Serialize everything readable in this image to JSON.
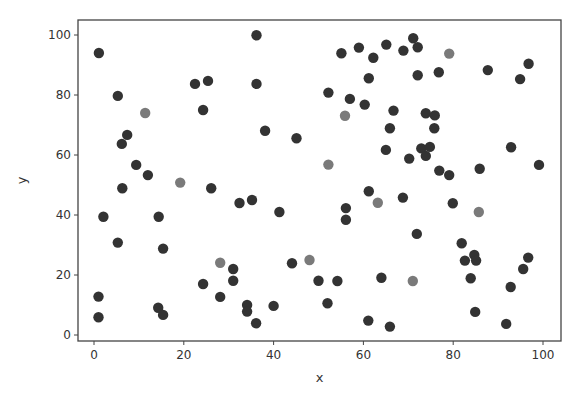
{
  "chart_data": {
    "type": "scatter",
    "title": "",
    "xlabel": "x",
    "ylabel": "y",
    "xlim": [
      -3.5,
      104
    ],
    "ylim": [
      -2,
      105
    ],
    "xticks": [
      0,
      20,
      40,
      60,
      80,
      100
    ],
    "yticks": [
      0,
      20,
      40,
      60,
      80,
      100
    ],
    "grid": false,
    "legend": null,
    "series": [
      {
        "name": "dark",
        "color": "#333333",
        "points": [
          [
            1.1,
            94
          ],
          [
            5.3,
            79.7
          ],
          [
            7.4,
            66.7
          ],
          [
            6.2,
            63.7
          ],
          [
            9.4,
            56.7
          ],
          [
            12,
            53.3
          ],
          [
            22.5,
            83.7
          ],
          [
            25.4,
            84.7
          ],
          [
            24.3,
            75
          ],
          [
            6.3,
            48.9
          ],
          [
            26.1,
            48.9
          ],
          [
            2.1,
            39.4
          ],
          [
            14.4,
            39.4
          ],
          [
            5.3,
            30.8
          ],
          [
            15.4,
            28.8
          ],
          [
            31,
            22
          ],
          [
            31,
            18.1
          ],
          [
            24.3,
            17
          ],
          [
            28.1,
            12.7
          ],
          [
            1.0,
            12.8
          ],
          [
            14.3,
            9.1
          ],
          [
            15.4,
            6.7
          ],
          [
            1.0,
            5.9
          ],
          [
            36.2,
            99.9
          ],
          [
            36.2,
            83.7
          ],
          [
            38.1,
            68.1
          ],
          [
            45.1,
            65.6
          ],
          [
            55.1,
            93.9
          ],
          [
            59,
            95.8
          ],
          [
            62.2,
            92.4
          ],
          [
            65.1,
            96.8
          ],
          [
            68.9,
            94.8
          ],
          [
            71.1,
            98.9
          ],
          [
            72.1,
            95.9
          ],
          [
            61.2,
            85.6
          ],
          [
            52.2,
            80.8
          ],
          [
            57,
            78.7
          ],
          [
            60.3,
            76.8
          ],
          [
            66.7,
            74.8
          ],
          [
            65.9,
            68.9
          ],
          [
            65,
            61.7
          ],
          [
            72.1,
            86.6
          ],
          [
            76.8,
            87.6
          ],
          [
            87.7,
            88.3
          ],
          [
            96.8,
            90.4
          ],
          [
            94.9,
            85.3
          ],
          [
            73.9,
            73.9
          ],
          [
            75.9,
            73.2
          ],
          [
            75.8,
            68.9
          ],
          [
            72.9,
            62.2
          ],
          [
            74.8,
            62.7
          ],
          [
            73.9,
            59.7
          ],
          [
            70.2,
            58.8
          ],
          [
            76.9,
            54.8
          ],
          [
            79.1,
            53.3
          ],
          [
            85.9,
            55.4
          ],
          [
            92.9,
            62.6
          ],
          [
            99.1,
            56.7
          ],
          [
            32.4,
            44
          ],
          [
            35.2,
            45
          ],
          [
            41.3,
            41
          ],
          [
            61.2,
            47.9
          ],
          [
            56.1,
            42.3
          ],
          [
            56.1,
            38.4
          ],
          [
            44.1,
            23.9
          ],
          [
            50,
            18.1
          ],
          [
            54.2,
            18
          ],
          [
            64,
            19.1
          ],
          [
            52,
            10.6
          ],
          [
            34.1,
            10
          ],
          [
            34.1,
            7.8
          ],
          [
            40,
            9.7
          ],
          [
            36.1,
            3.9
          ],
          [
            61.1,
            4.8
          ],
          [
            65.9,
            2.8
          ],
          [
            68.8,
            45.8
          ],
          [
            79.9,
            43.9
          ],
          [
            71.9,
            33.7
          ],
          [
            81.9,
            30.6
          ],
          [
            82.6,
            24.8
          ],
          [
            84.7,
            26.7
          ],
          [
            85.1,
            24.8
          ],
          [
            96.7,
            25.8
          ],
          [
            95.6,
            22
          ],
          [
            83.9,
            18.9
          ],
          [
            92.8,
            16
          ],
          [
            84.9,
            7.7
          ],
          [
            91.8,
            3.7
          ]
        ]
      },
      {
        "name": "gray",
        "color": "#7a7a7a",
        "points": [
          [
            11.4,
            74
          ],
          [
            19.2,
            50.8
          ],
          [
            28.1,
            24.1
          ],
          [
            55.9,
            73.1
          ],
          [
            52.2,
            56.8
          ],
          [
            79.1,
            93.8
          ],
          [
            63.2,
            44.1
          ],
          [
            48,
            25
          ],
          [
            85.7,
            41
          ],
          [
            71,
            18
          ]
        ]
      }
    ]
  },
  "axes": {
    "x_label": "x",
    "y_label": "y"
  }
}
